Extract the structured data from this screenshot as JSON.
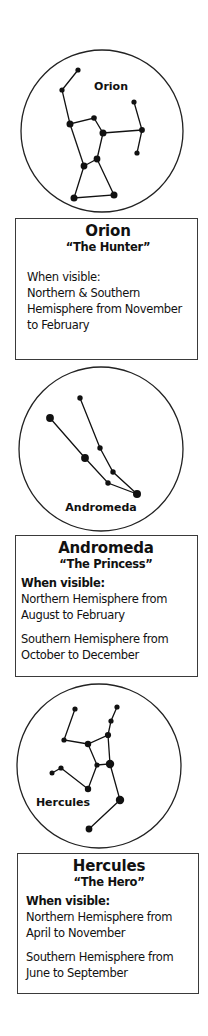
{
  "constellations": [
    {
      "name": "Orion",
      "diagram_label": "Orion",
      "nickname": "“The Hunter”",
      "visibility_label": "When visible:",
      "visibility": [
        [
          "Northern & Southern",
          "Hemisphere from November",
          "to February"
        ]
      ]
    },
    {
      "name": "Andromeda",
      "diagram_label": "Andromeda",
      "nickname": "“The Princess”",
      "visibility_label": "When visible:",
      "visibility": [
        [
          "Northern Hemisphere from",
          "August to February"
        ],
        [
          "Southern Hemisphere from",
          "October to December"
        ]
      ]
    },
    {
      "name": "Hercules",
      "diagram_label": "Hercules",
      "nickname": "“The Hero”",
      "visibility_label": "When visible:",
      "visibility": [
        [
          "Northern Hemisphere from",
          "April to November"
        ],
        [
          "Southern Hemisphere from",
          "June to September"
        ]
      ]
    }
  ],
  "colors": {
    "star": "#111111",
    "circle_stroke": "#222222",
    "card_border": "#3a3a3a",
    "background": "#ffffff"
  }
}
